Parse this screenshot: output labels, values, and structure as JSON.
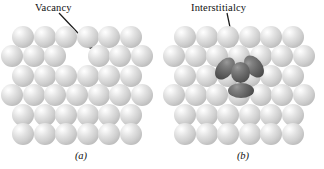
{
  "figure": {
    "width": 324,
    "height": 169,
    "background": "#ffffff",
    "type": "schematic-diagram"
  },
  "panels": [
    {
      "id": "a",
      "caption": "(a)",
      "label": "Vacancy",
      "label_color": "#111111",
      "defect": {
        "kind": "vacancy",
        "description": "missing atom site in the second lattice row",
        "row": 2,
        "column": 4
      },
      "arrow": {
        "from": [
          60,
          15
        ],
        "to": [
          96,
          52
        ],
        "color": "#1a1a1a",
        "head": "solid"
      },
      "lattice": {
        "rows": 6,
        "atom_diameter": 22,
        "atom_color": "#cfcfcf",
        "row_counts": [
          6,
          6,
          6,
          6,
          6,
          6
        ],
        "stagger": "alternating half-pitch offset"
      }
    },
    {
      "id": "b",
      "caption": "(b)",
      "label": "Interstitialcy",
      "label_color": "#111111",
      "defect": {
        "kind": "interstitialcy",
        "description": "self-interstitial cluster: two tilted ellipsoidal atoms flanking a displaced central atom, with one atom below",
        "atom_color": "#5a5a5a",
        "members": 4
      },
      "arrow": {
        "from": [
          66,
          15
        ],
        "to": [
          78,
          72
        ],
        "color": "#1a1a1a",
        "head": "solid"
      },
      "lattice": {
        "rows": 6,
        "atom_diameter": 22,
        "atom_color": "#cfcfcf",
        "row_counts": [
          6,
          6,
          6,
          6,
          6,
          6
        ],
        "stagger": "alternating half-pitch offset"
      }
    }
  ]
}
